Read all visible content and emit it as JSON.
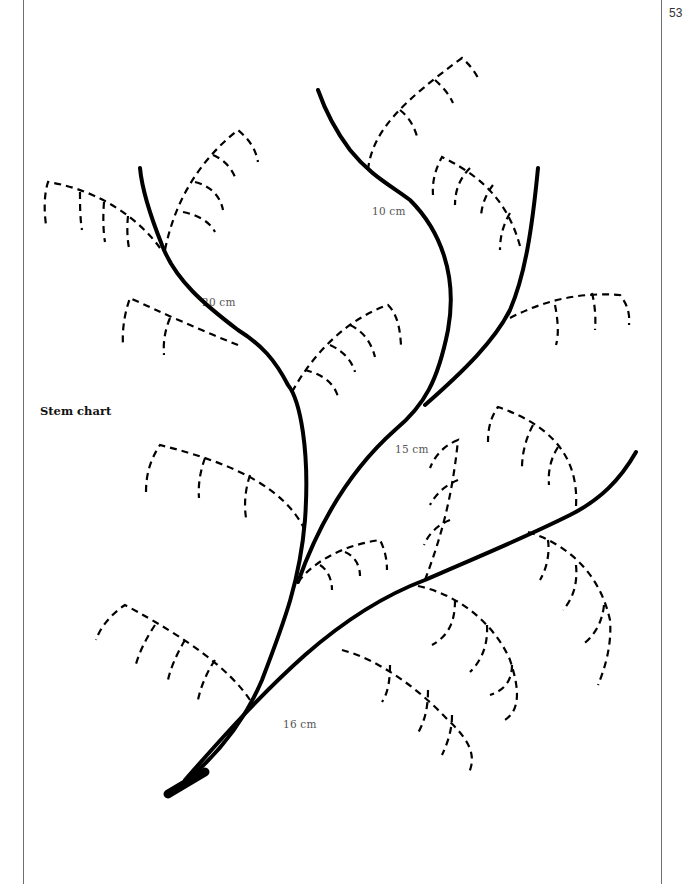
{
  "page": {
    "number": "53",
    "caption": "Stem chart"
  },
  "measurements": [
    {
      "label": "10 cm",
      "x": 372,
      "y": 205
    },
    {
      "label": "20 cm",
      "x": 202,
      "y": 296
    },
    {
      "label": "15 cm",
      "x": 395,
      "y": 443
    },
    {
      "label": "16 cm",
      "x": 283,
      "y": 718
    }
  ],
  "colors": {
    "ink": "#000000",
    "label_text": "#555555",
    "border": "#6e6e6e",
    "background": "#ffffff"
  },
  "stems": [
    {
      "name": "main-stem-left",
      "length_label": "20 cm"
    },
    {
      "name": "middle-stem",
      "length_label": "10 cm"
    },
    {
      "name": "right-upper-stem",
      "length_label": "15 cm"
    },
    {
      "name": "lower-right-stem",
      "length_label": "16 cm"
    }
  ]
}
